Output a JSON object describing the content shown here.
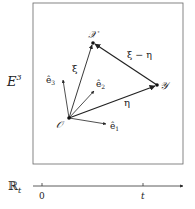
{
  "diagram": {
    "space_label": "E",
    "space_superscript": "3",
    "time_axis_label": "ℝ",
    "time_axis_subscript": "t",
    "points": {
      "origin": {
        "label": "𝒪",
        "x": 69,
        "y": 118
      },
      "X": {
        "label": "𝒳",
        "x": 93,
        "y": 43
      },
      "Y": {
        "label": "𝒴",
        "x": 157,
        "y": 85
      }
    },
    "vectors": {
      "xi": {
        "label": "ξ",
        "from": "origin",
        "to": "X"
      },
      "eta": {
        "label": "η",
        "from": "origin",
        "to": "Y"
      },
      "xi_minus_eta": {
        "label": "ξ − η",
        "from": "Y",
        "to": "X"
      }
    },
    "basis": {
      "e1": {
        "label": "ê",
        "sub": "1"
      },
      "e2": {
        "label": "ê",
        "sub": "2"
      },
      "e3": {
        "label": "ê",
        "sub": "3"
      }
    },
    "ticks": [
      {
        "label": "0",
        "x": 42
      },
      {
        "label": "t",
        "x": 143
      }
    ],
    "colors": {
      "stroke": "#222222",
      "frame": "#555555"
    }
  }
}
